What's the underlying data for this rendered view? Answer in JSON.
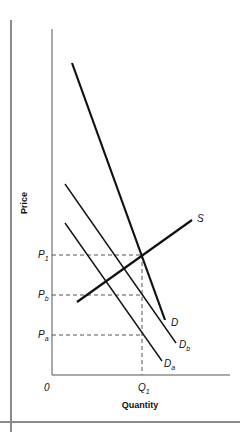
{
  "diagram": {
    "type": "supply-demand",
    "axes": {
      "x_label": "Quantity",
      "y_label": "Price",
      "origin_label": "0"
    },
    "price_labels": {
      "p1": {
        "main": "P",
        "sub": "1"
      },
      "pb": {
        "main": "P",
        "sub": "b"
      },
      "pa": {
        "main": "P",
        "sub": "a"
      }
    },
    "quantity_labels": {
      "q1": {
        "main": "Q",
        "sub": "1"
      }
    },
    "curves": [
      {
        "id": "S",
        "label": "S",
        "sub": ""
      },
      {
        "id": "D",
        "label": "D",
        "sub": ""
      },
      {
        "id": "Db",
        "label": "D",
        "sub": "b"
      },
      {
        "id": "Da",
        "label": "D",
        "sub": "a"
      }
    ],
    "colors": {
      "line": "#111111",
      "axis": "#555555",
      "frame": "#8a8a8a",
      "dashed": "#555555"
    }
  }
}
